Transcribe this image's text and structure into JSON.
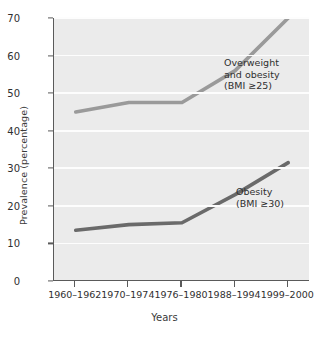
{
  "chart_data": {
    "type": "line",
    "title": "",
    "xlabel": "Years",
    "ylabel": "Prevalence (percentage)",
    "categories": [
      "1960–1962",
      "1970–1974",
      "1976–1980",
      "1988–1994",
      "1999–2000"
    ],
    "ylim": [
      0,
      70
    ],
    "yticks": [
      0,
      10,
      20,
      30,
      40,
      50,
      60,
      70
    ],
    "ytick_labels": [
      "0",
      "10",
      "20",
      "30",
      "40",
      "50",
      "60",
      "70"
    ],
    "grid": "horizontal",
    "legend_position": "inline-annotations",
    "series": [
      {
        "name": "Overweight and obesity (BMI ≥25)",
        "annotation_lines": [
          "Overweight",
          "and obesity",
          "(BMI ≥25)"
        ],
        "color": "#9a9a9a",
        "values": [
          45,
          47.5,
          47.5,
          56,
          70
        ]
      },
      {
        "name": "Obesity (BMI ≥30)",
        "annotation_lines": [
          "Obesity",
          "(BMI ≥30)"
        ],
        "color": "#6a6a6a",
        "values": [
          13.5,
          15,
          15.5,
          23,
          31.5
        ]
      }
    ]
  },
  "figure": {
    "background": "#ffffff",
    "plot_background": "#ebebeb",
    "gridline_color": "#fdfdfd",
    "axis_color": "#5a5a5a",
    "text_color": "#2f2f2f"
  }
}
